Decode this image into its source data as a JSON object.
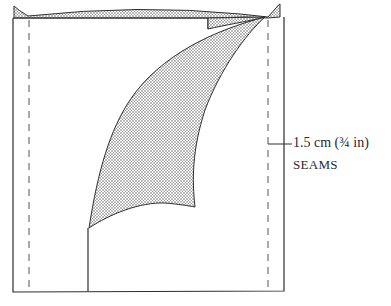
{
  "diagram": {
    "type": "sewing pattern diagram",
    "colors": {
      "line": "#2e2e2e",
      "shading_dot": "#555555",
      "background": "#ffffff"
    },
    "annotation": {
      "measurement": "1.5 cm (¾ in)",
      "caption": "SEAMS"
    },
    "elements": [
      "outer-rectangle",
      "left-seam-allowance-dashed-line",
      "right-seam-allowance-dashed-line",
      "top-shaded-band",
      "curved-shaded-panel",
      "vertical-cut-line"
    ]
  }
}
